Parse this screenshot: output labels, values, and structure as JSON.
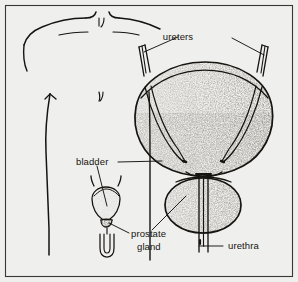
{
  "figure": {
    "background_color": "#efefed",
    "ink_color": "#161410",
    "frame_color": "#3a3833",
    "width": 298,
    "height": 282
  },
  "labels": {
    "ureters": "ureters",
    "bladder": "bladder",
    "prostate_line1": "prostate",
    "prostate_line2": "gland",
    "urethra": "urethra"
  },
  "parts": {
    "torso": "male-torso-outline",
    "bladder_main": "bladder-enlarged-view",
    "prostate_main": "prostate-gland-enlarged-view",
    "urethra_main": "urethra-tube",
    "ureter_left": "left-ureter-stub",
    "ureter_right": "right-ureter-stub",
    "inset": "small-scale-urinary-tract-inset"
  }
}
